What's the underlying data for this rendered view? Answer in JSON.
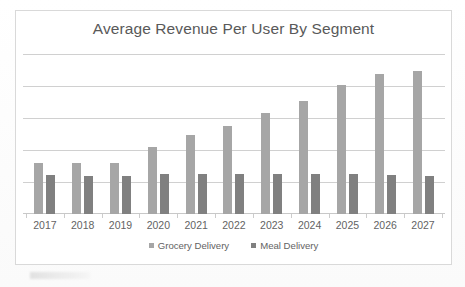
{
  "chart_data": {
    "type": "bar",
    "title": "Average Revenue Per User By Segment",
    "xlabel": "",
    "ylabel": "",
    "categories": [
      "2017",
      "2018",
      "2019",
      "2020",
      "2021",
      "2022",
      "2023",
      "2024",
      "2025",
      "2026",
      "2027"
    ],
    "series": [
      {
        "name": "Grocery Delivery",
        "color": "#a6a6a6",
        "values": [
          1.6,
          1.6,
          1.6,
          2.09,
          2.47,
          2.75,
          3.16,
          3.53,
          4.03,
          4.38,
          4.47
        ]
      },
      {
        "name": "Meal Delivery",
        "color": "#808080",
        "values": [
          1.22,
          1.19,
          1.19,
          1.25,
          1.25,
          1.25,
          1.25,
          1.25,
          1.25,
          1.22,
          1.19
        ]
      }
    ],
    "ylim": [
      0,
      5
    ],
    "y_gridlines": [
      1,
      2,
      3,
      4,
      5
    ],
    "y_tick_labels_visible": false,
    "grid": true,
    "legend_position": "bottom"
  },
  "legend": {
    "items": [
      {
        "label": "Grocery Delivery",
        "swatch": "grocery-swatch"
      },
      {
        "label": "Meal Delivery",
        "swatch": "meal-swatch"
      }
    ]
  },
  "colors": {
    "grocery": "#a6a6a6",
    "meal": "#808080",
    "gridline": "#d0d0d0",
    "border": "#d9d9d9",
    "title_text": "#595959",
    "axis_text": "#636363"
  }
}
